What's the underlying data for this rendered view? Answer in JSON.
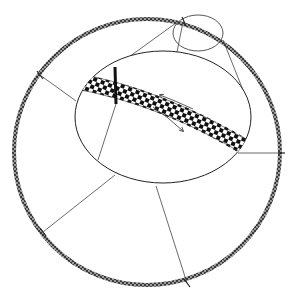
{
  "diagram": {
    "type": "magnified-cross-section",
    "colors": {
      "background": "#ffffff",
      "line": "#333333",
      "ring": "#555555",
      "band": "#111111"
    },
    "outer_ring": {
      "cx": 147,
      "cy": 152,
      "r": 133
    },
    "magnifier_circle": {
      "cx": 198,
      "cy": 33,
      "rx": 25,
      "ry": 18
    },
    "inner_ellipse": {
      "cx": 163,
      "cy": 117,
      "rx": 88,
      "ry": 66
    },
    "band": {
      "path": "M88,85 Q160,100 238,150",
      "marker_x": 115
    },
    "arrows": [
      {
        "direction": "up-left",
        "label": ""
      },
      {
        "direction": "down-right",
        "label": ""
      }
    ]
  }
}
